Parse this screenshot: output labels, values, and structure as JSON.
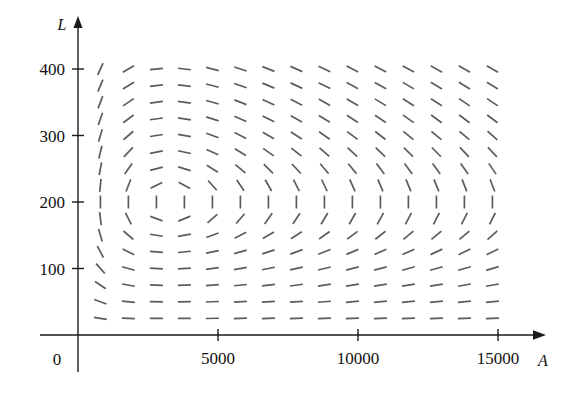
{
  "figure": {
    "type": "slope-field",
    "background_color": "#ffffff",
    "segment_color": "#5c5c5c",
    "axis_color": "#1a1a1a"
  },
  "axes": {
    "x": {
      "label": "A",
      "tick_labels": [
        "5000",
        "10000",
        "15000"
      ],
      "tick_values": [
        5000,
        10000,
        15000
      ],
      "origin_label": "0",
      "min": 0,
      "max": 16400,
      "pixel_origin_x": 78,
      "pixel_per_unit": 0.028,
      "arrow": true
    },
    "y": {
      "label": "L",
      "tick_labels": [
        "100",
        "200",
        "300",
        "400"
      ],
      "tick_values": [
        100,
        200,
        300,
        400
      ],
      "min": 0,
      "max": 470,
      "pixel_origin_y": 335,
      "pixel_per_unit": 0.665,
      "arrow": true
    }
  },
  "chart_data": {
    "type": "scatter",
    "title": "",
    "xlabel": "A",
    "ylabel": "L",
    "xlim": [
      0,
      16400
    ],
    "ylim": [
      0,
      470
    ],
    "grid": false,
    "legend": null,
    "model": {
      "name": "Lotka-Volterra predator-prey",
      "dA_dt": "k*A - a*A*L",
      "dL_dt": "-c*L + d*A*L",
      "k": 0.08,
      "a": 0.0004,
      "c": 0.02,
      "d": 6.25e-06,
      "equilibrium_A": 3200,
      "equilibrium_L": 200
    },
    "grid_spec": {
      "x_start": 800,
      "x_step": 1000,
      "x_count": 15,
      "y_start": 25,
      "y_step": 25,
      "y_count": 16
    },
    "segment_length_px": 13
  }
}
